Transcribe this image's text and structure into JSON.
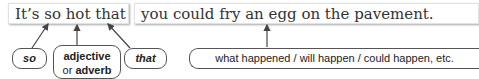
{
  "sentence": {
    "part1": "It’s so hot that",
    "part2": "you could fry an egg on the pavement."
  },
  "labels": {
    "so": "so",
    "adjective": "adjective",
    "or": "or",
    "adverb": "adverb",
    "that": "that",
    "result": "what happened / will happen / could happen, etc."
  },
  "colors": {
    "text": "#333333",
    "border": "#555555",
    "arrow": "#444444"
  }
}
